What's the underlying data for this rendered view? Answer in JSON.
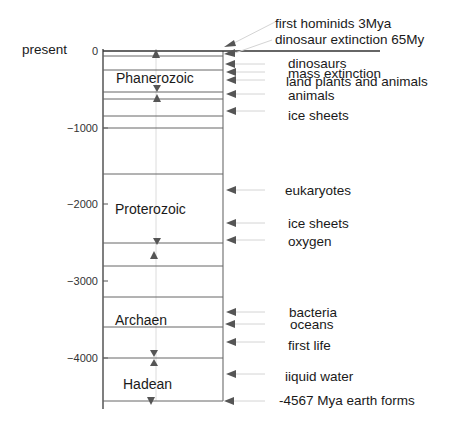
{
  "diagram": {
    "present_label": "present",
    "axis": {
      "ticks": [
        {
          "value": 0,
          "label": "0",
          "y": 51
        },
        {
          "value": -1000,
          "label": "−1000",
          "y": 128
        },
        {
          "value": -2000,
          "label": "−2000",
          "y": 204
        },
        {
          "value": -3000,
          "label": "−3000",
          "y": 281
        },
        {
          "value": -4000,
          "label": "−4000",
          "y": 358
        }
      ],
      "unit": "Mya"
    },
    "eras": [
      {
        "name": "Phanerozoic",
        "start": -541,
        "end": 0
      },
      {
        "name": "Proterozoic",
        "start": -2500,
        "end": -541
      },
      {
        "name": "Archaen",
        "start": -4000,
        "end": -2500
      },
      {
        "name": "Hadean",
        "start": -4567,
        "end": -4000
      }
    ],
    "boundary_lines_y": [
      51,
      56,
      70,
      92,
      99,
      116,
      174,
      243,
      266,
      297,
      327,
      358,
      401
    ],
    "events": [
      {
        "label": "first hominids 3Mya",
        "y": 46
      },
      {
        "label": "dinosaur extinction 65My",
        "y": 55
      },
      {
        "label": "dinosaurs",
        "y": 64
      },
      {
        "label": "mass extinction",
        "y": 72
      },
      {
        "label": "land plants and animals",
        "y": 80
      },
      {
        "label": "animals",
        "y": 94
      },
      {
        "label": "ice sheets",
        "y": 111
      },
      {
        "label": "eukaryotes",
        "y": 190
      },
      {
        "label": "ice sheets",
        "y": 223
      },
      {
        "label": "oxygen",
        "y": 240
      },
      {
        "label": "bacteria",
        "y": 312
      },
      {
        "label": "oceans",
        "y": 324
      },
      {
        "label": "first life",
        "y": 342
      },
      {
        "label": "iiquid water",
        "y": 374
      },
      {
        "label": "-4567 Mya earth forms",
        "y": 401
      }
    ],
    "colors": {
      "line": "#555555",
      "arrow": "#555555",
      "leader": "#d0d0d0",
      "center": "#dddddd"
    }
  }
}
